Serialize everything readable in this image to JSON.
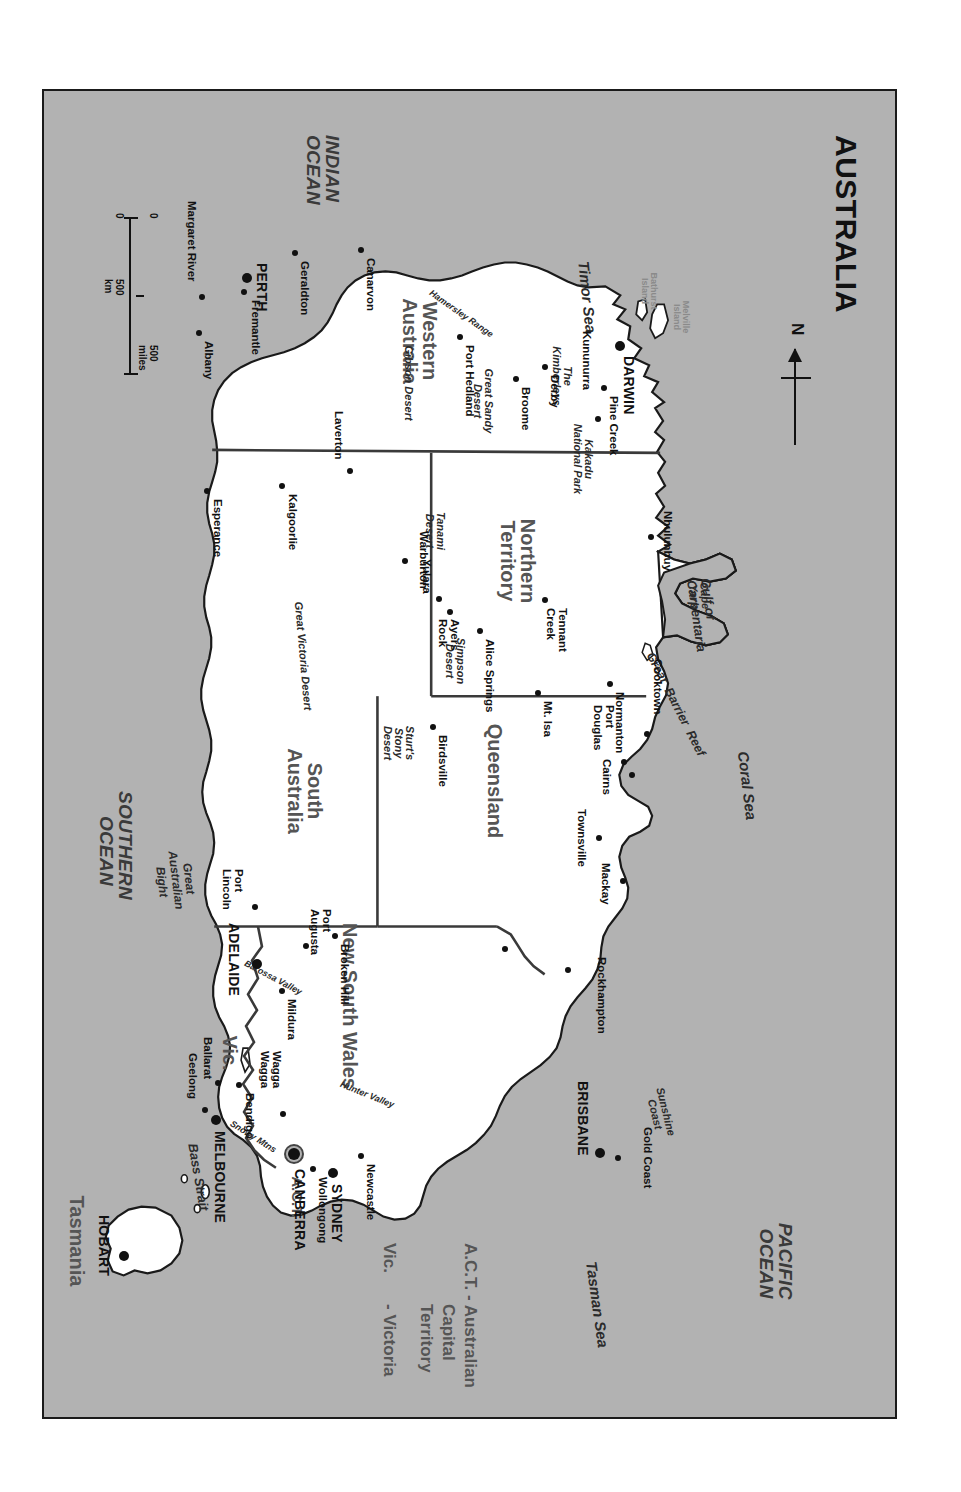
{
  "map": {
    "title": "AUSTRALIA",
    "background_color": "#b2b2b2",
    "land_color": "#ffffff",
    "border_color": "#1a1a1a",
    "north_arrow_label": "N"
  },
  "scale_bar": {
    "miles_zero": "0",
    "miles_max": "500 miles",
    "km_zero": "0",
    "km_max": "500 km"
  },
  "legend": {
    "line1": "A.C.T. - Australian",
    "line2": "Capital",
    "line3": "Territory",
    "line4": "Vic.",
    "line5": "- Victoria"
  },
  "oceans": [
    {
      "name": "INDIAN\nOCEAN"
    },
    {
      "name": "PACIFIC\nOCEAN"
    },
    {
      "name": "SOUTHERN\nOCEAN"
    }
  ],
  "seas": [
    {
      "name": "Timor Sea"
    },
    {
      "name": "Coral Sea"
    },
    {
      "name": "Tasman Sea"
    },
    {
      "name": "Bass Strait"
    },
    {
      "name": "Gulf of\nCarpentaria"
    },
    {
      "name": "Great\nAustralian\nBight"
    },
    {
      "name": "Great  Barrier  Reef"
    }
  ],
  "states": [
    {
      "name": "Western\nAustralia"
    },
    {
      "name": "Northern\nTerritory"
    },
    {
      "name": "South\nAustralia"
    },
    {
      "name": "Queensland"
    },
    {
      "name": "New South Wales"
    },
    {
      "name": "Vic."
    },
    {
      "name": "A.C.T."
    },
    {
      "name": "Tasmania"
    }
  ],
  "physical_features": [
    {
      "name": "Cape\nYork"
    },
    {
      "name": "The\nKimberleys"
    },
    {
      "name": "Great Sandy\nDesert"
    },
    {
      "name": "Gibson Desert"
    },
    {
      "name": "Great Victoria Desert"
    },
    {
      "name": "Tanami\nDesert"
    },
    {
      "name": "Simpson\nDesert"
    },
    {
      "name": "Sturt's\nStony\nDesert"
    },
    {
      "name": "Hamersley Range"
    },
    {
      "name": "Kakadu\nNational Park"
    },
    {
      "name": "Sunshine\nCoast"
    },
    {
      "name": "Hunter Valley"
    },
    {
      "name": "Snowy Mtns"
    },
    {
      "name": "Barossa Valley"
    },
    {
      "name": "Melville\nIsland"
    },
    {
      "name": "Bathurst\nIsland"
    }
  ],
  "capitals": [
    {
      "name": "DARWIN"
    },
    {
      "name": "PERTH"
    },
    {
      "name": "ADELAIDE"
    },
    {
      "name": "BRISBANE"
    },
    {
      "name": "SYDNEY"
    },
    {
      "name": "CANBERRA"
    },
    {
      "name": "MELBOURNE"
    },
    {
      "name": "HOBART"
    }
  ],
  "cities": [
    {
      "name": "Nhulunbuy"
    },
    {
      "name": "Pine Creek"
    },
    {
      "name": "Kununurra"
    },
    {
      "name": "Derby"
    },
    {
      "name": "Broome"
    },
    {
      "name": "Port Hedland"
    },
    {
      "name": "Canarvon"
    },
    {
      "name": "Geraldton"
    },
    {
      "name": "Fremantle"
    },
    {
      "name": "Margaret River"
    },
    {
      "name": "Albany"
    },
    {
      "name": "Esperance"
    },
    {
      "name": "Kalgoorlie"
    },
    {
      "name": "Laverton"
    },
    {
      "name": "Warburton"
    },
    {
      "name": "Yulara"
    },
    {
      "name": "Ayers\nRock"
    },
    {
      "name": "Alice Springs"
    },
    {
      "name": "Tennant\nCreek"
    },
    {
      "name": "Normanton"
    },
    {
      "name": "Mt. Isa"
    },
    {
      "name": "Birdsville"
    },
    {
      "name": "Cooktown"
    },
    {
      "name": "Port\nDouglas"
    },
    {
      "name": "Cairns"
    },
    {
      "name": "Townsville"
    },
    {
      "name": "Mackay"
    },
    {
      "name": "Rockhampton"
    },
    {
      "name": "Gold Coast"
    },
    {
      "name": "Newcastle"
    },
    {
      "name": "Wollongong"
    },
    {
      "name": "Wagga\nWagga"
    },
    {
      "name": "Broken Hill"
    },
    {
      "name": "Mildura"
    },
    {
      "name": "Bendigo"
    },
    {
      "name": "Ballarat"
    },
    {
      "name": "Geelong"
    },
    {
      "name": "Port\nAugusta"
    },
    {
      "name": "Port\nLincoln"
    }
  ]
}
